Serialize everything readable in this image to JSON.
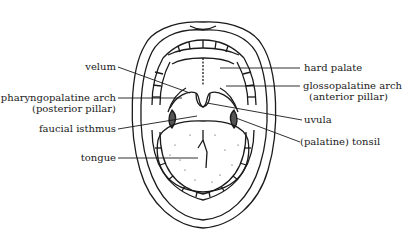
{
  "diagram": {
    "labels_left": [
      {
        "id": "velum",
        "text": "velum"
      },
      {
        "id": "pharyngopalatine",
        "line1": "pharyngopalatine arch",
        "line2": "(posterior pillar)"
      },
      {
        "id": "faucial",
        "text": "faucial isthmus"
      },
      {
        "id": "tongue",
        "text": "tongue"
      }
    ],
    "labels_right": [
      {
        "id": "hard-palate",
        "text": "hard palate"
      },
      {
        "id": "glossopalatine",
        "line1": "glossopalatine arch",
        "line2": "(anterior pillar)"
      },
      {
        "id": "uvula",
        "text": "uvula"
      },
      {
        "id": "tonsil",
        "text": "(palatine) tonsil"
      }
    ],
    "colors": {
      "ink": "#1a1a1a",
      "background": "#ffffff"
    }
  }
}
